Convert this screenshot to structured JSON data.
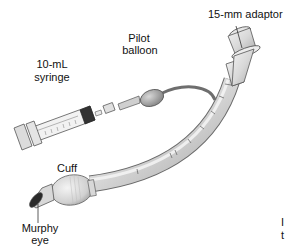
{
  "figure": {
    "labels": {
      "adaptor": "15-mm adaptor",
      "pilot_balloon_line1": "Pilot",
      "pilot_balloon_line2": "balloon",
      "syringe_line1": "10-mL",
      "syringe_line2": "syringe",
      "cuff": "Cuff",
      "murphy_eye_line1": "Murphy",
      "murphy_eye_line2": "eye"
    },
    "cropped_text": {
      "line1": "I",
      "line2": "t"
    },
    "colors": {
      "tube": "#dcdcdc",
      "tube_shade": "#9a9a9a",
      "outline": "#555555",
      "pilot_line": "#6e6e6e",
      "balloon": "#a9a9a9",
      "plunger_tip": "#333333",
      "background": "#ffffff"
    }
  }
}
